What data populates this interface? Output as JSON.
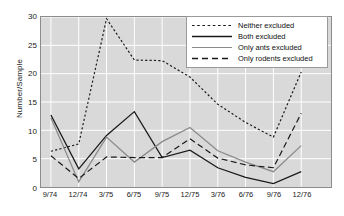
{
  "chart_data": {
    "type": "line",
    "title": "",
    "xlabel": "",
    "ylabel": "Number/Sample",
    "ylim": [
      0,
      30
    ],
    "yticks": [
      0,
      5,
      10,
      15,
      20,
      25,
      30
    ],
    "grid": true,
    "legend_position": "upper right",
    "categories": [
      "9/74",
      "12/74",
      "3/75",
      "6/75",
      "9/75",
      "12/75",
      "3/76",
      "6/76",
      "9/76",
      "12/76"
    ],
    "series": [
      {
        "name": "Neither excluded",
        "style": "dotted",
        "color": "#1a1a1a",
        "values": [
          6.3,
          7.6,
          29.7,
          22.4,
          22.3,
          19.4,
          14.6,
          11.4,
          8.8,
          20.3
        ]
      },
      {
        "name": "Both excluded",
        "style": "solid",
        "color": "#1a1a1a",
        "values": [
          12.7,
          3.2,
          9.1,
          13.3,
          5.2,
          6.5,
          3.4,
          1.7,
          0.6,
          2.7
        ]
      },
      {
        "name": "Only ants excluded",
        "style": "solid",
        "color": "#8a8a8a",
        "values": [
          12.2,
          0.9,
          8.8,
          4.4,
          8.0,
          10.5,
          6.4,
          4.4,
          2.7,
          7.3
        ]
      },
      {
        "name": "Only rodents excluded",
        "style": "dashed",
        "color": "#1a1a1a",
        "values": [
          5.5,
          1.5,
          5.3,
          5.2,
          5.2,
          8.5,
          5.1,
          3.9,
          3.4,
          13.0
        ]
      }
    ]
  },
  "axes": {
    "ylabel": "Number/Sample",
    "ytick_labels": [
      "0",
      "5",
      "10",
      "15",
      "20",
      "25",
      "30"
    ],
    "xtick_labels": [
      "9/74",
      "12/74",
      "3/75",
      "6/75",
      "9/75",
      "12/75",
      "3/76",
      "6/76",
      "9/76",
      "12/76"
    ]
  },
  "legend": {
    "items": [
      {
        "label": "Neither excluded"
      },
      {
        "label": "Both excluded"
      },
      {
        "label": "Only ants excluded"
      },
      {
        "label": "Only rodents excluded"
      }
    ]
  }
}
